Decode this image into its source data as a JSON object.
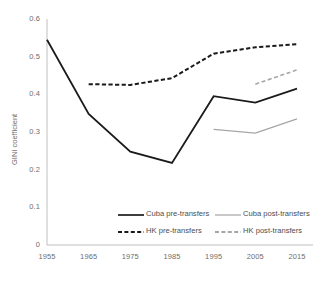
{
  "chart_data": {
    "type": "line",
    "title": "",
    "xlabel": "",
    "ylabel": "GINI coefficient",
    "categories": [
      1955,
      1965,
      1975,
      1985,
      1995,
      2005,
      2015
    ],
    "xtick_labels": [
      "1955",
      "1965",
      "1975",
      "1985",
      "1995",
      "2005",
      "2015"
    ],
    "ytick_labels": [
      "0",
      "0.1",
      "0.2",
      "0.3",
      "0.4",
      "0.5",
      "0.6"
    ],
    "ytick_values": [
      0,
      0.1,
      0.2,
      0.3,
      0.4,
      0.5,
      0.6
    ],
    "ylim": [
      0,
      0.6
    ],
    "xlim": [
      1955,
      2015
    ],
    "grid": false,
    "legend_position": "inside-bottom",
    "series": [
      {
        "name": "Cuba pre-transfers",
        "style": "solid",
        "color": "#1a1a1a",
        "width": 1.8,
        "x": [
          1955,
          1965,
          1975,
          1985,
          1995,
          2005,
          2015
        ],
        "values": [
          0.545,
          0.348,
          0.248,
          0.218,
          0.395,
          0.378,
          0.415
        ]
      },
      {
        "name": "Cuba post-transfers",
        "style": "solid",
        "color": "#a6a6a6",
        "width": 1.4,
        "x": [
          1995,
          2005,
          2015
        ],
        "values": [
          0.307,
          0.297,
          0.335
        ]
      },
      {
        "name": "HK pre-transfers",
        "style": "dashed",
        "color": "#1a1a1a",
        "width": 2.0,
        "x": [
          1965,
          1975,
          1985,
          1995,
          2005,
          2015
        ],
        "values": [
          0.427,
          0.425,
          0.443,
          0.508,
          0.525,
          0.533
        ]
      },
      {
        "name": "HK post-transfers",
        "style": "dashed",
        "color": "#a6a6a6",
        "width": 1.6,
        "x": [
          2005,
          2015
        ],
        "values": [
          0.427,
          0.465
        ]
      }
    ]
  },
  "legend": {
    "entries": [
      {
        "label": "Cuba pre-transfers",
        "style": "solid",
        "color": "#1a1a1a"
      },
      {
        "label": "Cuba post-transfers",
        "style": "solid",
        "color": "#a6a6a6"
      },
      {
        "label": "HK pre-transfers",
        "style": "dashed",
        "color": "#1a1a1a"
      },
      {
        "label": "HK post-transfers",
        "style": "dashed",
        "color": "#a6a6a6"
      }
    ]
  },
  "axes": {
    "axis_color": "#bfbfbf",
    "label_color": "#6e6e6e"
  }
}
